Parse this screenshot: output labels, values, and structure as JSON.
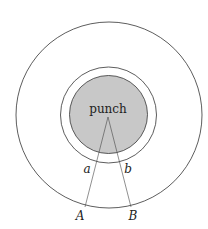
{
  "diagram": {
    "center_label": "punch",
    "inner_labels": {
      "left": "a",
      "right": "b"
    },
    "outer_labels": {
      "left": "A",
      "right": "B"
    },
    "colors": {
      "stroke": "#333333",
      "punch_fill": "#c8c8c8",
      "background": "#ffffff"
    },
    "circles": [
      {
        "name": "outer",
        "cx": 109,
        "cy": 115,
        "r": 93
      },
      {
        "name": "middle",
        "cx": 108.5,
        "cy": 115,
        "r": 48
      },
      {
        "name": "punch",
        "cx": 108.5,
        "cy": 114.5,
        "r": 39
      }
    ]
  }
}
